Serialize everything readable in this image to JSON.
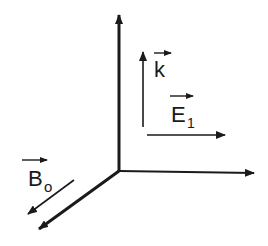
{
  "diagram": {
    "axes": [
      {
        "name": "vertical-axis"
      },
      {
        "name": "horizontal-axis"
      },
      {
        "name": "depth-axis"
      }
    ],
    "vectors": {
      "k": {
        "symbol": "k",
        "subscript": ""
      },
      "E1": {
        "symbol": "E",
        "subscript": "1"
      },
      "B0": {
        "symbol": "B",
        "subscript": "o"
      }
    },
    "colors": {
      "ink": "#1a1a1a",
      "background": "#ffffff"
    }
  }
}
